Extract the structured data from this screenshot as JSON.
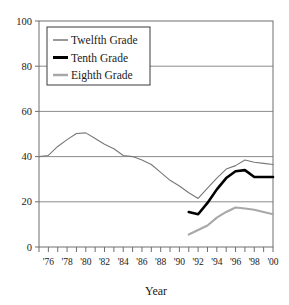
{
  "chart_data": {
    "type": "line",
    "title": "",
    "xlabel": "Year",
    "ylabel": "",
    "ylim": [
      0,
      100
    ],
    "xlim": [
      1975,
      2000
    ],
    "grid": "horizontal",
    "legend_position": "top-left inside plot",
    "y_ticks": [
      0,
      20,
      40,
      60,
      80,
      100
    ],
    "y_tick_labels": [
      "0",
      "20",
      "40",
      "60",
      "80",
      "100"
    ],
    "x_ticks": [
      1975,
      1976,
      1977,
      1978,
      1979,
      1980,
      1981,
      1982,
      1983,
      1984,
      1985,
      1986,
      1987,
      1988,
      1989,
      1990,
      1991,
      1992,
      1993,
      1994,
      1995,
      1996,
      1997,
      1998,
      1999,
      2000
    ],
    "x_tick_labels": [
      "'76",
      "'78",
      "'80",
      "'82",
      "'84",
      "'86",
      "'88",
      "'90",
      "'92",
      "'94",
      "'96",
      "'98",
      "'00"
    ],
    "x_labeled_years": [
      1976,
      1978,
      1980,
      1982,
      1984,
      1986,
      1988,
      1990,
      1992,
      1994,
      1996,
      1998,
      2000
    ],
    "series": [
      {
        "name": "Twelfth Grade",
        "color": "#777777",
        "width": 1.1,
        "x": [
          1975,
          1976,
          1977,
          1978,
          1979,
          1980,
          1981,
          1982,
          1983,
          1984,
          1985,
          1986,
          1987,
          1988,
          1989,
          1990,
          1991,
          1992,
          1993,
          1994,
          1995,
          1996,
          1997,
          1998,
          1999,
          2000
        ],
        "values": [
          40.0,
          40.5,
          44.5,
          47.5,
          50.2,
          50.5,
          48.0,
          45.5,
          43.5,
          40.5,
          40.0,
          38.5,
          36.5,
          33.0,
          29.5,
          27.0,
          24.0,
          21.5,
          26.0,
          30.5,
          34.5,
          36.0,
          38.5,
          37.5,
          37.0,
          36.5
        ]
      },
      {
        "name": "Tenth Grade",
        "color": "#000000",
        "width": 2.6,
        "x": [
          1991,
          1992,
          1993,
          1994,
          1995,
          1996,
          1997,
          1998,
          1999,
          2000
        ],
        "values": [
          15.5,
          14.5,
          19.5,
          25.5,
          30.5,
          33.5,
          34.0,
          31.0,
          31.0,
          31.0
        ]
      },
      {
        "name": "Eighth Grade",
        "color": "#a8a8a8",
        "width": 2.1,
        "x": [
          1991,
          1992,
          1993,
          1994,
          1995,
          1996,
          1997,
          1998,
          1999,
          2000
        ],
        "values": [
          5.5,
          7.5,
          9.5,
          13.0,
          15.5,
          17.5,
          17.0,
          16.5,
          15.5,
          14.5
        ]
      }
    ]
  },
  "legend": {
    "entries": [
      {
        "label": "Twelfth Grade"
      },
      {
        "label": "Tenth Grade"
      },
      {
        "label": "Eighth Grade"
      }
    ]
  },
  "axis": {
    "x_title": "Year"
  }
}
